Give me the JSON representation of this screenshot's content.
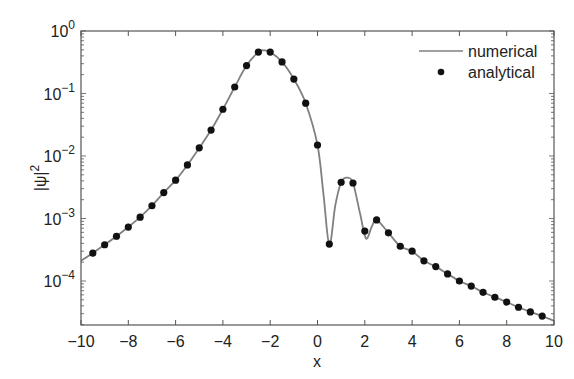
{
  "chart_data": {
    "type": "line",
    "title": "",
    "xlabel": "x",
    "ylabel": "|ψ|²",
    "xlim": [
      -10,
      10
    ],
    "ylim": [
      2e-05,
      1
    ],
    "yscale": "log",
    "grid": false,
    "legend_position": "upper right",
    "x_ticks": [
      -10,
      -8,
      -6,
      -4,
      -2,
      0,
      2,
      4,
      6,
      8,
      10
    ],
    "x_tick_labels": [
      "−10",
      "−8",
      "−6",
      "−4",
      "−2",
      "0",
      "2",
      "4",
      "6",
      "8",
      "10"
    ],
    "y_ticks": [
      1,
      0.1,
      0.01,
      0.001,
      0.0001
    ],
    "y_tick_labels": [
      {
        "base": "10",
        "exp": "0"
      },
      {
        "base": "10",
        "exp": "−1"
      },
      {
        "base": "10",
        "exp": "−2"
      },
      {
        "base": "10",
        "exp": "−3"
      },
      {
        "base": "10",
        "exp": "−4"
      }
    ],
    "series": [
      {
        "name": "numerical",
        "style": "line",
        "color": "#808080",
        "x": [
          -10,
          -9.5,
          -9,
          -8.5,
          -8,
          -7.5,
          -7,
          -6.5,
          -6,
          -5.5,
          -5,
          -4.5,
          -4,
          -3.5,
          -3,
          -2.5,
          -2.25,
          -2,
          -1.5,
          -1,
          -0.5,
          0,
          0.25,
          0.5,
          0.75,
          1,
          1.25,
          1.5,
          1.8,
          2.05,
          2.3,
          2.5,
          3,
          3.5,
          4,
          4.5,
          5,
          5.5,
          6,
          6.5,
          7,
          7.5,
          8,
          8.5,
          9,
          9.5,
          10
        ],
        "y": [
          0.00021,
          0.00028,
          0.00038,
          0.00052,
          0.00073,
          0.00105,
          0.0016,
          0.0026,
          0.0041,
          0.0072,
          0.0135,
          0.026,
          0.056,
          0.127,
          0.28,
          0.46,
          0.49,
          0.46,
          0.32,
          0.17,
          0.07,
          0.015,
          0.0025,
          0.00038,
          0.0016,
          0.0038,
          0.0045,
          0.0037,
          0.0012,
          0.00048,
          0.00075,
          0.00095,
          0.00059,
          0.00036,
          0.0003,
          0.00021,
          0.00017,
          0.00013,
          0.0001,
          8.3e-05,
          6.6e-05,
          5.5e-05,
          4.6e-05,
          3.8e-05,
          3.2e-05,
          2.75e-05,
          2.3e-05
        ]
      },
      {
        "name": "analytical",
        "style": "markers",
        "color": "#111111",
        "x": [
          -9.5,
          -9,
          -8.5,
          -8,
          -7.5,
          -7,
          -6.5,
          -6,
          -5.5,
          -5,
          -4.5,
          -4,
          -3.5,
          -3,
          -2.5,
          -2,
          -1.5,
          -1,
          -0.5,
          0,
          0.5,
          1,
          1.5,
          2,
          2.5,
          3,
          3.5,
          4,
          4.5,
          5,
          5.5,
          6,
          6.5,
          7,
          7.5,
          8,
          8.5,
          9,
          9.5
        ],
        "y": [
          0.00028,
          0.00038,
          0.00052,
          0.00073,
          0.00105,
          0.0016,
          0.0026,
          0.0041,
          0.0072,
          0.0135,
          0.026,
          0.056,
          0.127,
          0.28,
          0.46,
          0.46,
          0.32,
          0.17,
          0.07,
          0.015,
          0.00039,
          0.0038,
          0.0037,
          0.00063,
          0.00095,
          0.00059,
          0.00036,
          0.0003,
          0.00021,
          0.00017,
          0.00013,
          0.0001,
          8.3e-05,
          6.6e-05,
          5.5e-05,
          4.6e-05,
          3.8e-05,
          3.2e-05,
          2.75e-05
        ]
      }
    ]
  },
  "legend": {
    "items": [
      {
        "label": "numerical",
        "marker": "line"
      },
      {
        "label": "analytical",
        "marker": "dot"
      }
    ]
  },
  "axes": {
    "xlabel": "x",
    "ylabel_base": "|ψ|",
    "ylabel_exp": "2"
  }
}
